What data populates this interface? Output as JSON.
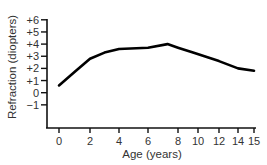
{
  "chart_data": {
    "type": "line",
    "title": "",
    "xlabel": "Age (years)",
    "ylabel": "Refraction (diopters)",
    "x_ticks": [
      "0",
      "2",
      "4",
      "6",
      "8",
      "10",
      "12",
      "14",
      "15"
    ],
    "y_ticks": [
      "+6",
      "+5",
      "+4",
      "+3",
      "+2",
      "+1",
      "0",
      "−1"
    ],
    "ylim": [
      -1,
      6
    ],
    "grid": false,
    "legend": null,
    "series": [
      {
        "name": "Refraction",
        "x": [
          0,
          1,
          2,
          3,
          4,
          6,
          7.3,
          8,
          9.5,
          12,
          14,
          15
        ],
        "values": [
          0.6,
          1.7,
          2.8,
          3.3,
          3.6,
          3.7,
          4.0,
          3.7,
          3.3,
          2.6,
          2.0,
          1.8
        ]
      }
    ]
  }
}
